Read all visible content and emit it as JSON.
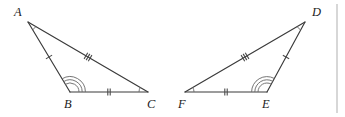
{
  "figure": {
    "type": "geometry-diagram",
    "stroke_color": "#3a3a3a",
    "mark_color": "#6e6e6e",
    "label_color": "#1c1c1c",
    "divider_color": "#c6c6c6",
    "background": "#ffffff"
  },
  "triangles": [
    {
      "name": "triangle-abc",
      "vertices": [
        {
          "label": "A",
          "x": 28,
          "y": 22,
          "label_x": 14,
          "label_y": 16,
          "arcs": 1
        },
        {
          "label": "B",
          "x": 70,
          "y": 92,
          "label_x": 64,
          "label_y": 108,
          "arcs": 3
        },
        {
          "label": "C",
          "x": 148,
          "y": 92,
          "label_x": 147,
          "label_y": 108,
          "arcs": 1
        }
      ],
      "sides": [
        {
          "name": "side-ab",
          "from": "A",
          "to": "B",
          "ticks": 1
        },
        {
          "name": "side-bc",
          "from": "B",
          "to": "C",
          "ticks": 2
        },
        {
          "name": "side-ac",
          "from": "A",
          "to": "C",
          "ticks": 3
        }
      ]
    },
    {
      "name": "triangle-def",
      "vertices": [
        {
          "label": "D",
          "x": 305,
          "y": 22,
          "label_x": 312,
          "label_y": 16,
          "arcs": 1
        },
        {
          "label": "E",
          "x": 267,
          "y": 92,
          "label_x": 262,
          "label_y": 108,
          "arcs": 3
        },
        {
          "label": "F",
          "x": 185,
          "y": 92,
          "label_x": 178,
          "label_y": 108,
          "arcs": 1
        }
      ],
      "sides": [
        {
          "name": "side-de",
          "from": "D",
          "to": "E",
          "ticks": 1
        },
        {
          "name": "side-fe",
          "from": "F",
          "to": "E",
          "ticks": 2
        },
        {
          "name": "side-fd",
          "from": "F",
          "to": "D",
          "ticks": 3
        }
      ]
    }
  ],
  "divider": {
    "name": "panel-divider",
    "x": 337,
    "y1": 4,
    "y2": 113
  }
}
